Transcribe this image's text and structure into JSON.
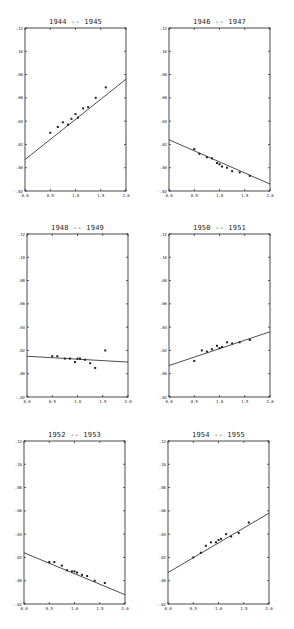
{
  "chart_data": [
    {
      "type": "scatter",
      "title": "1944 -- 1945",
      "xlabel": "",
      "ylabel": "",
      "xlim": [
        0.0,
        2.0
      ],
      "ylim": [
        -0.02,
        0.12
      ],
      "xticks": [
        "0.0",
        "0.5",
        "1.0",
        "1.5",
        "2.0"
      ],
      "yticks": [
        "-.02",
        ".00",
        ".02",
        ".04",
        ".06",
        ".08",
        ".10",
        ".12"
      ],
      "grid": false,
      "legend": null,
      "points": {
        "x": [
          0.5,
          0.65,
          0.75,
          0.85,
          0.92,
          1.0,
          1.05,
          1.15,
          1.25,
          1.4,
          1.6
        ],
        "y": [
          0.03,
          0.035,
          0.039,
          0.037,
          0.042,
          0.046,
          0.043,
          0.051,
          0.052,
          0.06,
          0.069
        ]
      },
      "fit_line": {
        "x": [
          0.0,
          2.0
        ],
        "y": [
          0.007,
          0.076
        ]
      }
    },
    {
      "type": "scatter",
      "title": "1946 -- 1947",
      "xlabel": "",
      "ylabel": "",
      "xlim": [
        0.0,
        2.0
      ],
      "ylim": [
        -0.02,
        0.12
      ],
      "xticks": [
        "0.0",
        "0.5",
        "1.0",
        "1.5",
        "2.0"
      ],
      "yticks": [
        "-.02",
        ".00",
        ".02",
        ".04",
        ".06",
        ".08",
        ".10",
        ".12"
      ],
      "grid": false,
      "legend": null,
      "points": {
        "x": [
          0.5,
          0.6,
          0.75,
          0.85,
          0.95,
          1.0,
          1.05,
          1.15,
          1.25,
          1.4,
          1.6
        ],
        "y": [
          0.016,
          0.012,
          0.009,
          0.008,
          0.004,
          0.003,
          0.001,
          0.0,
          -0.003,
          -0.004,
          -0.007
        ]
      },
      "fit_line": {
        "x": [
          0.0,
          2.0
        ],
        "y": [
          0.024,
          -0.014
        ]
      }
    },
    {
      "type": "scatter",
      "title": "1948 -- 1949",
      "xlabel": "",
      "ylabel": "",
      "xlim": [
        0.0,
        2.0
      ],
      "ylim": [
        -0.02,
        0.12
      ],
      "xticks": [
        "0.0",
        "0.5",
        "1.0",
        "1.5",
        "2.0"
      ],
      "yticks": [
        "-.02",
        ".00",
        ".02",
        ".04",
        ".06",
        ".08",
        ".10",
        ".12"
      ],
      "grid": false,
      "legend": null,
      "points": {
        "x": [
          0.5,
          0.6,
          0.75,
          0.85,
          0.95,
          1.0,
          1.05,
          1.15,
          1.25,
          1.35,
          1.55
        ],
        "y": [
          0.015,
          0.015,
          0.013,
          0.013,
          0.01,
          0.013,
          0.013,
          0.012,
          0.009,
          0.005,
          0.02
        ]
      },
      "fit_line": {
        "x": [
          0.0,
          2.0
        ],
        "y": [
          0.015,
          0.01
        ]
      }
    },
    {
      "type": "scatter",
      "title": "1950 -- 1951",
      "xlabel": "",
      "ylabel": "",
      "xlim": [
        0.0,
        2.0
      ],
      "ylim": [
        -0.02,
        0.12
      ],
      "xticks": [
        "0.0",
        "0.5",
        "1.0",
        "1.5",
        "2.0"
      ],
      "yticks": [
        "-.02",
        ".00",
        ".02",
        ".04",
        ".06",
        ".08",
        ".10",
        ".12"
      ],
      "grid": false,
      "legend": null,
      "points": {
        "x": [
          0.5,
          0.65,
          0.75,
          0.85,
          0.95,
          1.0,
          1.05,
          1.15,
          1.25,
          1.4,
          1.6
        ],
        "y": [
          0.011,
          0.02,
          0.019,
          0.021,
          0.024,
          0.022,
          0.023,
          0.027,
          0.026,
          0.027,
          0.029
        ]
      },
      "fit_line": {
        "x": [
          0.0,
          2.0
        ],
        "y": [
          0.007,
          0.036
        ]
      }
    },
    {
      "type": "scatter",
      "title": "1952 -- 1953",
      "xlabel": "",
      "ylabel": "",
      "xlim": [
        0.0,
        2.0
      ],
      "ylim": [
        -0.02,
        0.12
      ],
      "xticks": [
        "0.0",
        "0.5",
        "1.0",
        "1.5",
        "2.0"
      ],
      "yticks": [
        "-.02",
        ".00",
        ".02",
        ".04",
        ".06",
        ".08",
        ".10",
        ".12"
      ],
      "grid": false,
      "legend": null,
      "points": {
        "x": [
          0.5,
          0.6,
          0.75,
          0.85,
          0.95,
          1.0,
          1.05,
          1.15,
          1.25,
          1.4,
          1.6
        ],
        "y": [
          0.016,
          0.016,
          0.013,
          0.009,
          0.008,
          0.008,
          0.007,
          0.005,
          0.004,
          0.0,
          -0.002
        ]
      },
      "fit_line": {
        "x": [
          0.0,
          2.0
        ],
        "y": [
          0.024,
          -0.012
        ]
      }
    },
    {
      "type": "scatter",
      "title": "1954 -- 1955",
      "xlabel": "",
      "ylabel": "",
      "xlim": [
        0.0,
        2.0
      ],
      "ylim": [
        -0.02,
        0.12
      ],
      "xticks": [
        "0.0",
        "0.5",
        "1.0",
        "1.5",
        "2.0"
      ],
      "yticks": [
        "-.02",
        ".00",
        ".02",
        ".04",
        ".06",
        ".08",
        ".10",
        ".12"
      ],
      "grid": false,
      "legend": null,
      "points": {
        "x": [
          0.5,
          0.65,
          0.75,
          0.85,
          0.95,
          1.0,
          1.05,
          1.15,
          1.25,
          1.4,
          1.6
        ],
        "y": [
          0.02,
          0.024,
          0.03,
          0.033,
          0.033,
          0.035,
          0.036,
          0.04,
          0.038,
          0.041,
          0.05
        ]
      },
      "fit_line": {
        "x": [
          0.0,
          2.0
        ],
        "y": [
          0.007,
          0.058
        ]
      }
    }
  ],
  "panels": [
    {
      "title": "1944 -- 1945"
    },
    {
      "title": "1946 -- 1947"
    },
    {
      "title": "1948 -- 1949"
    },
    {
      "title": "1950 -- 1951"
    },
    {
      "title": "1952 -- 1953"
    },
    {
      "title": "1954 -- 1955"
    }
  ],
  "style": {
    "ink": "#1f1f1f",
    "background": "#ffffff"
  }
}
